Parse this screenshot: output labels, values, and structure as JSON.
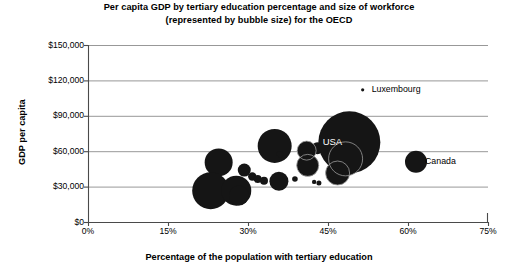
{
  "chart_data": {
    "type": "scatter",
    "title": "Per capita GDP by tertiary education percentage and size of workforce (represented by bubble size) for the OECD",
    "title_line1": "Per capita GDP by tertiary education percentage and size of workforce",
    "title_line2": "(represented by bubble size) for the OECD",
    "xlabel": "Percentage of the population with tertiary education",
    "ylabel": "GDP per capita",
    "xlim": [
      0,
      75
    ],
    "ylim": [
      0,
      150000
    ],
    "xticks": [
      "0%",
      "15%",
      "30%",
      "45%",
      "60%",
      "75%"
    ],
    "xtick_values": [
      0,
      15,
      30,
      45,
      60,
      75
    ],
    "yticks": [
      "$0",
      "$30,000",
      "$60,000",
      "$90,000",
      "$120,000",
      "$150,000"
    ],
    "ytick_values": [
      0,
      30000,
      60000,
      90000,
      120000,
      150000
    ],
    "grid": "horizontal",
    "legend": "none",
    "bubble_color": "#151515",
    "annotations": [
      {
        "label": "Luxembourg",
        "x": 51.5,
        "y": 112000
      },
      {
        "label": "USA",
        "x": 44.0,
        "y": 67500,
        "inside": true
      },
      {
        "label": "Canada",
        "x": 61.5,
        "y": 51000
      }
    ],
    "points": [
      {
        "x": 24.5,
        "y": 50500,
        "size": 14.0
      },
      {
        "x": 23.0,
        "y": 26500,
        "size": 18.5
      },
      {
        "x": 27.8,
        "y": 26500,
        "size": 15.0
      },
      {
        "x": 28.3,
        "y": 22500,
        "size": 10.0
      },
      {
        "x": 29.3,
        "y": 44000,
        "size": 6.5
      },
      {
        "x": 30.8,
        "y": 38500,
        "size": 4.2
      },
      {
        "x": 31.8,
        "y": 36500,
        "size": 4.0
      },
      {
        "x": 33.0,
        "y": 35000,
        "size": 4.0
      },
      {
        "x": 35.0,
        "y": 64500,
        "size": 17.0
      },
      {
        "x": 36.0,
        "y": 57500,
        "size": 3.2
      },
      {
        "x": 35.8,
        "y": 34500,
        "size": 9.5
      },
      {
        "x": 38.8,
        "y": 36500,
        "size": 2.8
      },
      {
        "x": 41.0,
        "y": 60500,
        "size": 9.5
      },
      {
        "x": 41.2,
        "y": 48000,
        "size": 11.0
      },
      {
        "x": 42.4,
        "y": 34000,
        "size": 2.2
      },
      {
        "x": 43.3,
        "y": 33000,
        "size": 2.5
      },
      {
        "x": 43.0,
        "y": 62500,
        "size": 6.0
      },
      {
        "x": 45.6,
        "y": 57000,
        "size": 5.5
      },
      {
        "x": 51.5,
        "y": 112000,
        "size": 1.6
      },
      {
        "x": 49.0,
        "y": 67500,
        "size": 31.0
      },
      {
        "x": 48.3,
        "y": 53500,
        "size": 17.0
      },
      {
        "x": 46.8,
        "y": 41500,
        "size": 12.0
      },
      {
        "x": 61.5,
        "y": 51000,
        "size": 11.0
      }
    ]
  }
}
